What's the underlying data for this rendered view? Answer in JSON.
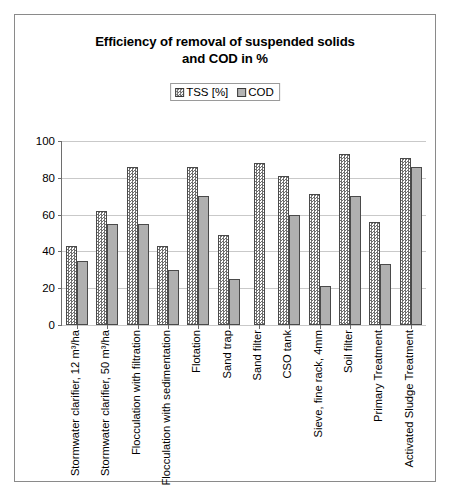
{
  "chart_data": {
    "type": "bar",
    "title": "Efficiency of removal of suspended solids and COD in %",
    "title_line1": "Efficiency of removal of suspended solids",
    "title_line2": "and COD in %",
    "xlabel": "",
    "ylabel": "",
    "ylim": [
      0,
      100
    ],
    "yticks": [
      0,
      20,
      40,
      60,
      80,
      100
    ],
    "grid": true,
    "legend_position": "top-center",
    "categories": [
      "Stormwater clarifier, 12 m³/ha",
      "Stormwater clarifier, 50 m³/ha",
      "Flocculation with filtration",
      "Flocculation with sedimentation",
      "Flotation",
      "Sand trap",
      "Sand filter",
      "CSO tank",
      "Sieve, fine rack, 4mm",
      "Soil filter",
      "Primary Treatment",
      "Activated Sludge Treatment"
    ],
    "series": [
      {
        "name": "TSS [%]",
        "color": "#ededed",
        "pattern": "checker",
        "values": [
          43,
          62,
          86,
          43,
          86,
          49,
          88,
          81,
          71,
          93,
          56,
          91
        ]
      },
      {
        "name": "COD",
        "color": "#b0b0b0",
        "pattern": "solid",
        "values": [
          35,
          55,
          55,
          30,
          70,
          25,
          0,
          60,
          21,
          70,
          33,
          86
        ]
      }
    ]
  },
  "legend": {
    "entries": [
      {
        "label": "TSS [%]",
        "swatch": "tss-swatch-icon"
      },
      {
        "label": "COD",
        "swatch": "cod-swatch-icon"
      }
    ]
  },
  "axis": {
    "y_tick_labels": [
      "100",
      "80",
      "60",
      "40",
      "20",
      "0"
    ]
  },
  "colors": {
    "frame_border": "#8a8a8a",
    "axis_line": "#6e6e6e",
    "gridline": "#c9c9c9",
    "bar_border": "#4a4a4a",
    "tss_fill": "#ededed",
    "cod_fill": "#b0b0b0",
    "background": "#ffffff"
  }
}
